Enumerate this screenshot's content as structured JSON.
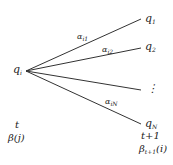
{
  "diagram": {
    "source_node": {
      "symbol": "q",
      "sub": "i"
    },
    "targets": [
      {
        "symbol": "q",
        "sub": "1"
      },
      {
        "symbol": "q",
        "sub": "2"
      },
      {
        "symbol": "⋮",
        "sub": ""
      },
      {
        "symbol": "q",
        "sub": "N"
      }
    ],
    "edges": [
      {
        "symbol": "α",
        "sub": "i1"
      },
      {
        "symbol": "α",
        "sub": "i2"
      },
      {
        "symbol": "α",
        "sub": "iN"
      }
    ],
    "left_time": "t",
    "left_beta": "β(j)",
    "right_time": "t+1",
    "right_beta": {
      "symbol": "β",
      "sub": "t+1",
      "arg": "(i)"
    }
  }
}
